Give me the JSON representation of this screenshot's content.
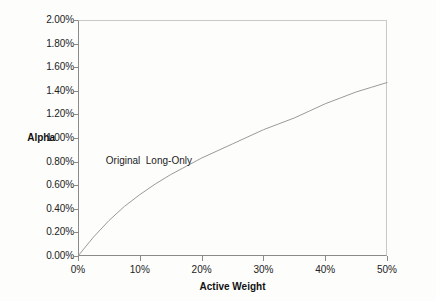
{
  "chart_data": {
    "type": "line",
    "title": "",
    "xlabel": "Active Weight",
    "ylabel": "Alpha",
    "xlim": [
      0,
      50
    ],
    "ylim": [
      0,
      2
    ],
    "grid": false,
    "legend_position": "inline-annotation",
    "x_tick_labels": [
      "0%",
      "10%",
      "20%",
      "30%",
      "40%",
      "50%"
    ],
    "x_ticks": [
      0,
      10,
      20,
      30,
      40,
      50
    ],
    "y_tick_labels": [
      "0.00%",
      "0.20%",
      "0.40%",
      "0.60%",
      "0.80%",
      "1.00%",
      "1.20%",
      "1.40%",
      "1.60%",
      "1.80%",
      "2.00%"
    ],
    "y_ticks": [
      0,
      0.2,
      0.4,
      0.6,
      0.8,
      1.0,
      1.2,
      1.4,
      1.6,
      1.8,
      2.0
    ],
    "annotations": [
      {
        "text": "Original  Long-Only",
        "x": 4.5,
        "y": 0.81
      }
    ],
    "series": [
      {
        "name": "Original Long-Only",
        "color": "#9a9a9a",
        "x": [
          0,
          2.5,
          5,
          7.5,
          10,
          12.5,
          15,
          17.5,
          20,
          22.5,
          25,
          27.5,
          30,
          32.5,
          35,
          37.5,
          40,
          42.5,
          45,
          47.5,
          50
        ],
        "y": [
          0.0,
          0.16,
          0.3,
          0.42,
          0.52,
          0.61,
          0.69,
          0.76,
          0.83,
          0.89,
          0.95,
          1.01,
          1.07,
          1.12,
          1.17,
          1.23,
          1.29,
          1.34,
          1.39,
          1.43,
          1.47
        ]
      }
    ]
  },
  "axes": {
    "y_title": "Alpha",
    "x_title": "Active Weight"
  }
}
